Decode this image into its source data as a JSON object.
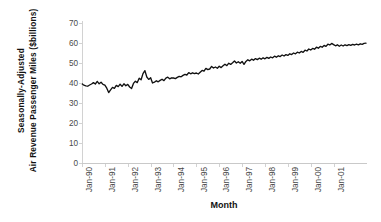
{
  "chart_data": {
    "type": "line",
    "title": "",
    "xlabel": "Month",
    "ylabel": "Seasonally-Adjusted Air Revenue Passenger Miles ($billions)",
    "ylabel_lines": [
      "Seasonally-Adjusted",
      "Air Revenue Passenger Miles ($billions)"
    ],
    "ylim": [
      0,
      70
    ],
    "yticks": [
      0,
      10,
      20,
      30,
      40,
      50,
      60,
      70
    ],
    "ytick_labels": [
      "0",
      "10",
      "20",
      "30",
      "40",
      "50",
      "60",
      "70"
    ],
    "xtick_labels": [
      "Jan-90",
      "Jan-91",
      "Jan-92",
      "Jan-93",
      "Jan-94",
      "Jan-95",
      "Jan-96",
      "Jan-97",
      "Jan-98",
      "Jan-99",
      "Jan-00",
      "Jan-01"
    ],
    "x_start": "Jan-90",
    "x_end": "Jun-02",
    "grid": false,
    "legend": false,
    "series_color": "#111111",
    "axis_color": "#d2d2d2",
    "tick_label_color": "#4a4a4a",
    "series": [
      {
        "name": "Air Revenue Passenger Miles",
        "values": [
          39.6,
          38.9,
          38.6,
          38.4,
          39.0,
          39.5,
          40.2,
          39.5,
          40.8,
          39.6,
          40.4,
          39.3,
          38.9,
          37.4,
          35.2,
          36.6,
          37.8,
          37.3,
          38.8,
          38.2,
          39.4,
          38.3,
          39.6,
          38.6,
          39.3,
          38.0,
          37.2,
          39.8,
          40.9,
          40.2,
          42.4,
          41.6,
          44.7,
          46.2,
          43.0,
          41.8,
          42.6,
          40.0,
          40.4,
          41.1,
          40.6,
          41.3,
          41.9,
          41.2,
          42.4,
          42.9,
          42.1,
          42.6,
          42.5,
          42.2,
          42.8,
          43.3,
          43.1,
          43.8,
          44.3,
          44.0,
          45.2,
          44.6,
          45.1,
          44.7,
          45.0,
          44.5,
          45.4,
          46.3,
          45.9,
          47.3,
          46.7,
          47.0,
          48.3,
          47.5,
          48.0,
          47.4,
          48.4,
          47.7,
          48.6,
          49.4,
          48.7,
          49.9,
          49.3,
          50.1,
          51.0,
          50.0,
          50.6,
          49.9,
          50.8,
          49.3,
          50.8,
          51.6,
          51.1,
          51.9,
          51.4,
          52.2,
          51.7,
          52.4,
          51.9,
          52.6,
          52.1,
          52.8,
          52.3,
          53.0,
          52.6,
          53.4,
          52.9,
          53.6,
          53.2,
          54.0,
          53.5,
          54.2,
          53.8,
          54.6,
          54.2,
          55.0,
          54.6,
          55.4,
          55.0,
          55.8,
          55.3,
          56.4,
          56.0,
          57.0,
          56.5,
          57.3,
          56.9,
          57.9,
          57.4,
          58.3,
          57.9,
          58.8,
          58.3,
          59.4,
          59.0,
          59.8,
          59.2,
          58.6,
          59.1,
          58.4,
          59.0,
          58.5,
          59.1,
          58.7,
          59.2,
          58.8,
          59.3,
          59.0,
          59.4,
          59.1,
          59.6,
          59.3,
          59.8,
          59.9
        ]
      }
    ]
  }
}
